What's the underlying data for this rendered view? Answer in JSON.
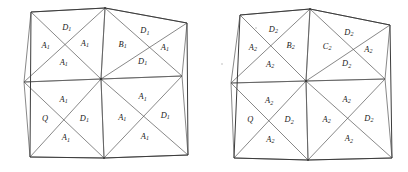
{
  "figure": {
    "kind": "triangulated-mesh-pair",
    "panels": [
      {
        "name": "left-mesh",
        "subscript": "1",
        "outline": [
          [
            31,
            12
          ],
          [
            105,
            8
          ],
          [
            187,
            23
          ],
          [
            188,
            155
          ],
          [
            104,
            158
          ],
          [
            30,
            157
          ]
        ],
        "vertices": {
          "top_left": [
            31,
            12
          ],
          "top_mid": [
            105,
            8
          ],
          "top_right": [
            187,
            23
          ],
          "mid_left": [
            24,
            82
          ],
          "center": [
            101,
            79
          ],
          "mid_right": [
            182,
            76
          ],
          "bottom_left": [
            30,
            157
          ],
          "bottom_mid": [
            104,
            158
          ],
          "bottom_right": [
            188,
            155
          ]
        },
        "quadrants": [
          {
            "name": "top-left-quadrant",
            "corners": [
              [
                31,
                12
              ],
              [
                105,
                8
              ],
              [
                101,
                79
              ],
              [
                24,
                82
              ]
            ],
            "cells": [
              {
                "position": "top",
                "label": "D",
                "sub": "1"
              },
              {
                "position": "left",
                "label": "A",
                "sub": "1"
              },
              {
                "position": "right",
                "label": "A",
                "sub": "1"
              },
              {
                "position": "bottom",
                "label": "A",
                "sub": "1"
              }
            ]
          },
          {
            "name": "top-right-quadrant",
            "corners": [
              [
                105,
                8
              ],
              [
                187,
                23
              ],
              [
                182,
                76
              ],
              [
                101,
                79
              ]
            ],
            "cells": [
              {
                "position": "top",
                "label": "D",
                "sub": "1"
              },
              {
                "position": "left",
                "label": "B",
                "sub": "1"
              },
              {
                "position": "right",
                "label": "A",
                "sub": "1"
              },
              {
                "position": "bottom",
                "label": "D",
                "sub": "1"
              }
            ]
          },
          {
            "name": "bottom-left-quadrant",
            "corners": [
              [
                24,
                82
              ],
              [
                101,
                79
              ],
              [
                104,
                158
              ],
              [
                30,
                157
              ]
            ],
            "cells": [
              {
                "position": "top",
                "label": "A",
                "sub": "1"
              },
              {
                "position": "left",
                "label": "Q",
                "sub": ""
              },
              {
                "position": "right",
                "label": "D",
                "sub": "1"
              },
              {
                "position": "bottom",
                "label": "A",
                "sub": "1"
              }
            ]
          },
          {
            "name": "bottom-right-quadrant",
            "corners": [
              [
                101,
                79
              ],
              [
                182,
                76
              ],
              [
                188,
                155
              ],
              [
                104,
                158
              ]
            ],
            "cells": [
              {
                "position": "top",
                "label": "A",
                "sub": "1"
              },
              {
                "position": "left",
                "label": "A",
                "sub": "1"
              },
              {
                "position": "right",
                "label": "D",
                "sub": "1"
              },
              {
                "position": "bottom",
                "label": "A",
                "sub": "1"
              }
            ]
          }
        ]
      },
      {
        "name": "right-mesh",
        "subscript": "2",
        "outline": [
          [
            240,
            15
          ],
          [
            310,
            9
          ],
          [
            390,
            25
          ],
          [
            392,
            158
          ],
          [
            308,
            160
          ],
          [
            234,
            158
          ]
        ],
        "vertices": {
          "top_left": [
            240,
            15
          ],
          "top_mid": [
            310,
            9
          ],
          "top_right": [
            390,
            25
          ],
          "mid_left": [
            231,
            83
          ],
          "center": [
            306,
            81
          ],
          "mid_right": [
            385,
            79
          ],
          "bottom_left": [
            234,
            158
          ],
          "bottom_mid": [
            308,
            160
          ],
          "bottom_right": [
            392,
            158
          ]
        },
        "quadrants": [
          {
            "name": "top-left-quadrant",
            "corners": [
              [
                240,
                15
              ],
              [
                310,
                9
              ],
              [
                306,
                81
              ],
              [
                231,
                83
              ]
            ],
            "cells": [
              {
                "position": "top",
                "label": "D",
                "sub": "2"
              },
              {
                "position": "left",
                "label": "A",
                "sub": "2"
              },
              {
                "position": "right",
                "label": "B",
                "sub": "2"
              },
              {
                "position": "bottom",
                "label": "A",
                "sub": "2"
              }
            ]
          },
          {
            "name": "top-right-quadrant",
            "corners": [
              [
                310,
                9
              ],
              [
                390,
                25
              ],
              [
                385,
                79
              ],
              [
                306,
                81
              ]
            ],
            "cells": [
              {
                "position": "top",
                "label": "D",
                "sub": "2"
              },
              {
                "position": "left",
                "label": "C",
                "sub": "2"
              },
              {
                "position": "right",
                "label": "A",
                "sub": "2"
              },
              {
                "position": "bottom",
                "label": "D",
                "sub": "2"
              }
            ]
          },
          {
            "name": "bottom-left-quadrant",
            "corners": [
              [
                231,
                83
              ],
              [
                306,
                81
              ],
              [
                308,
                160
              ],
              [
                234,
                158
              ]
            ],
            "cells": [
              {
                "position": "top",
                "label": "A",
                "sub": "2"
              },
              {
                "position": "left",
                "label": "Q",
                "sub": ""
              },
              {
                "position": "right",
                "label": "D",
                "sub": "2"
              },
              {
                "position": "bottom",
                "label": "A",
                "sub": "2"
              }
            ]
          },
          {
            "name": "bottom-right-quadrant",
            "corners": [
              [
                306,
                81
              ],
              [
                385,
                79
              ],
              [
                392,
                158
              ],
              [
                308,
                160
              ]
            ],
            "cells": [
              {
                "position": "top",
                "label": "A",
                "sub": "2"
              },
              {
                "position": "left",
                "label": "A",
                "sub": "2"
              },
              {
                "position": "right",
                "label": "D",
                "sub": "2"
              },
              {
                "position": "bottom",
                "label": "A",
                "sub": "2"
              }
            ]
          }
        ]
      }
    ],
    "colors": {
      "background": "#ffffff",
      "outline_stroke": "#3c3c3c",
      "edge_stroke": "#555555",
      "label_text": "#1a1a1a"
    },
    "specks": [
      [
        222,
        64
      ],
      [
        256,
        28
      ]
    ]
  }
}
